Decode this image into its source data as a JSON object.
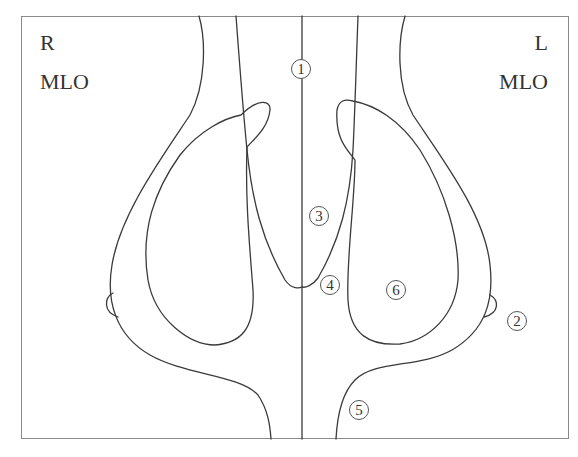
{
  "diagram": {
    "type": "schematic",
    "views": {
      "right": {
        "side": "R",
        "projection": "MLO"
      },
      "left": {
        "side": "L",
        "projection": "MLO"
      }
    },
    "markers": [
      {
        "id": "1",
        "symbol": "1"
      },
      {
        "id": "2",
        "symbol": "2"
      },
      {
        "id": "3",
        "symbol": "3"
      },
      {
        "id": "4",
        "symbol": "4"
      },
      {
        "id": "5",
        "symbol": "5"
      },
      {
        "id": "6",
        "symbol": "6"
      }
    ],
    "colors": {
      "line": "#3a3a3a",
      "frame": "#8a8a8a",
      "background": "#ffffff"
    }
  },
  "caption": {
    "text": ""
  }
}
